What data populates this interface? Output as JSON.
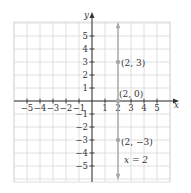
{
  "chart_data": {
    "type": "line",
    "title": "",
    "xlabel": "x",
    "ylabel": "y",
    "xlim": [
      -5.9,
      6
    ],
    "ylim": [
      -6,
      6
    ],
    "grid": true,
    "x_ticks": [
      -5,
      -4,
      -3,
      -2,
      -1,
      1,
      2,
      3,
      4,
      5
    ],
    "y_ticks": [
      -5,
      -4,
      -3,
      -2,
      -1,
      1,
      2,
      3,
      4,
      5
    ],
    "x_tick_labels": [
      "−5",
      "−4",
      "−3",
      "−2",
      "−1",
      "1",
      "2",
      "3",
      "4",
      "5"
    ],
    "y_tick_labels": [
      "−5",
      "−4",
      "−3",
      "−2",
      "−1",
      "1",
      "2",
      "3",
      "4",
      "5"
    ],
    "series": [
      {
        "name": "x = 2",
        "type": "vertical-line",
        "x": 2,
        "color": "#a0a0a0",
        "points": [
          {
            "x": 2,
            "y": 3,
            "label": "(2, 3)"
          },
          {
            "x": 2,
            "y": 0,
            "label": "(2, 0)"
          },
          {
            "x": 2,
            "y": -3,
            "label": "(2, −3)"
          }
        ]
      }
    ],
    "annotations": [
      {
        "text": "x = 2",
        "x": 2.6,
        "y": -4.2
      }
    ]
  },
  "labels": {
    "x_axis": "x",
    "y_axis": "y",
    "equation": "x = 2",
    "pt1": "(2, 3)",
    "pt2": "(2, 0)",
    "pt3": "(2, −3)"
  },
  "colors": {
    "grid": "#d8d8d8",
    "axis": "#333333",
    "line": "#a8a8a8",
    "point": "#a8a8a8"
  }
}
